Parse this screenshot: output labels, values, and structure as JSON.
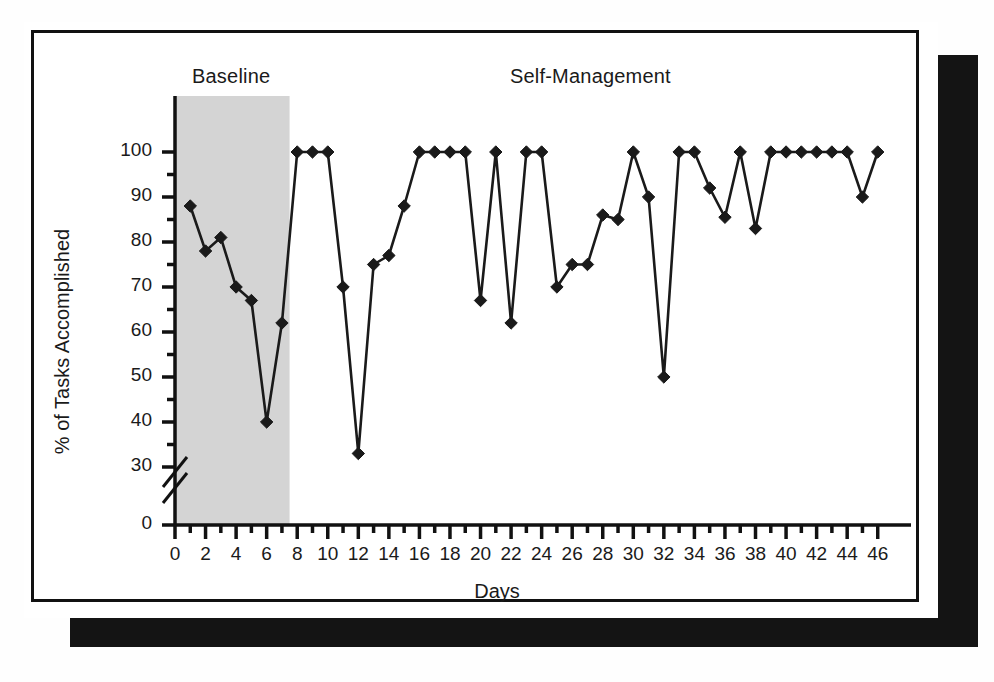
{
  "figure": {
    "background_color": "#ffffff",
    "frame_color": "#111111",
    "shadow_color": "#141414",
    "line_color": "#1a1a1a",
    "marker_color": "#1a1a1a",
    "phase_shade_color": "#d4d4d4"
  },
  "chart_data": {
    "type": "line",
    "title": "",
    "xlabel": "Days",
    "ylabel": "% of Tasks Accomplished",
    "xlim": [
      0,
      47
    ],
    "ylim": [
      0,
      105
    ],
    "y_axis_break": true,
    "y_axis_break_between": [
      0,
      28
    ],
    "grid": false,
    "legend_position": "none",
    "xticks": [
      0,
      2,
      4,
      6,
      8,
      10,
      12,
      14,
      16,
      18,
      20,
      22,
      24,
      26,
      28,
      30,
      32,
      34,
      36,
      38,
      40,
      42,
      44,
      46
    ],
    "xtick_labels": [
      "0",
      "2",
      "4",
      "6",
      "8",
      "10",
      "12",
      "14",
      "16",
      "18",
      "20",
      "22",
      "24",
      "26",
      "28",
      "30",
      "32",
      "34",
      "36",
      "38",
      "40",
      "42",
      "44",
      "46"
    ],
    "x_minor_ticks": [
      1,
      3,
      5,
      7,
      9,
      11,
      13,
      15,
      17,
      19,
      21,
      23,
      25,
      27,
      29,
      31,
      33,
      35,
      37,
      39,
      41,
      43,
      45
    ],
    "yticks": [
      0,
      30,
      40,
      50,
      60,
      70,
      80,
      90,
      100
    ],
    "ytick_labels": [
      "0",
      "30",
      "40",
      "50",
      "60",
      "70",
      "80",
      "90",
      "100"
    ],
    "y_minor_ticks": [
      35,
      45,
      55,
      65,
      75,
      85,
      95
    ],
    "marker": "diamond",
    "phases": [
      {
        "name": "Baseline",
        "label": "Baseline",
        "x_start": 0,
        "x_end": 7.5,
        "shaded": true
      },
      {
        "name": "Self-Management",
        "label": "Self-Management",
        "x_start": 7.5,
        "x_end": 47,
        "shaded": false
      }
    ],
    "series": [
      {
        "name": "% of Tasks Accomplished",
        "x": [
          1,
          2,
          3,
          4,
          5,
          6,
          7,
          8,
          9,
          10,
          11,
          12,
          13,
          14,
          15,
          16,
          17,
          18,
          19,
          20,
          21,
          22,
          23,
          24,
          25,
          26,
          27,
          28,
          29,
          30,
          31,
          32,
          33,
          34,
          35,
          36,
          37,
          38,
          39,
          40,
          41,
          42,
          43,
          44,
          45,
          46
        ],
        "values": [
          88,
          78,
          81,
          70,
          67,
          40,
          62,
          100,
          100,
          100,
          70,
          33,
          75,
          77,
          88,
          100,
          100,
          100,
          100,
          67,
          100,
          62,
          100,
          100,
          70,
          75,
          75,
          86,
          85,
          100,
          90,
          50,
          100,
          100,
          92,
          85.5,
          100,
          83,
          100,
          100,
          100,
          100,
          100,
          100,
          90,
          100
        ]
      }
    ]
  }
}
